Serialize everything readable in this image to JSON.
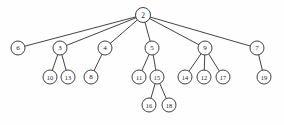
{
  "figure": {
    "background_color": "#fefefe",
    "node_fill_color": "#ffffff",
    "node_stroke_color": "#2b2b2b",
    "edge_color": "#2e2e2e",
    "label_color": "#1a1a1a",
    "width": 284,
    "height": 125
  },
  "chart_data": {
    "type": "diagram",
    "diagram_type": "tree",
    "title": "",
    "root": "2",
    "node_count": 19,
    "edge_count": 18,
    "depth": 4,
    "nodes": [
      {
        "id": "2",
        "label": "2",
        "x": 143,
        "y": 15,
        "r": 7.5,
        "level": 0,
        "font_size": 7.5
      },
      {
        "id": "6",
        "label": "6",
        "x": 18,
        "y": 48,
        "r": 7.0,
        "level": 1,
        "font_size": 7.0
      },
      {
        "id": "3",
        "label": "3",
        "x": 60,
        "y": 48,
        "r": 7.0,
        "level": 1,
        "font_size": 7.0
      },
      {
        "id": "4",
        "label": "4",
        "x": 105,
        "y": 48,
        "r": 7.0,
        "level": 1,
        "font_size": 7.0
      },
      {
        "id": "5",
        "label": "5",
        "x": 152,
        "y": 48,
        "r": 7.0,
        "level": 1,
        "font_size": 7.0
      },
      {
        "id": "9",
        "label": "9",
        "x": 205,
        "y": 48,
        "r": 7.0,
        "level": 1,
        "font_size": 7.0
      },
      {
        "id": "7",
        "label": "7",
        "x": 257,
        "y": 48,
        "r": 7.0,
        "level": 1,
        "font_size": 7.0
      },
      {
        "id": "10",
        "label": "10",
        "x": 50,
        "y": 77,
        "r": 7.0,
        "level": 2,
        "font_size": 6.4
      },
      {
        "id": "13",
        "label": "13",
        "x": 68,
        "y": 77,
        "r": 7.0,
        "level": 2,
        "font_size": 6.4
      },
      {
        "id": "8",
        "label": "8",
        "x": 91,
        "y": 77,
        "r": 7.0,
        "level": 2,
        "font_size": 7.0
      },
      {
        "id": "11",
        "label": "11",
        "x": 139,
        "y": 77,
        "r": 7.0,
        "level": 2,
        "font_size": 6.4
      },
      {
        "id": "15",
        "label": "15",
        "x": 157,
        "y": 77,
        "r": 7.0,
        "level": 2,
        "font_size": 6.4
      },
      {
        "id": "14",
        "label": "14",
        "x": 185,
        "y": 77,
        "r": 7.0,
        "level": 2,
        "font_size": 6.4
      },
      {
        "id": "12",
        "label": "12",
        "x": 204,
        "y": 77,
        "r": 7.0,
        "level": 2,
        "font_size": 6.4
      },
      {
        "id": "17",
        "label": "17",
        "x": 223,
        "y": 77,
        "r": 7.0,
        "level": 2,
        "font_size": 6.4
      },
      {
        "id": "19",
        "label": "19",
        "x": 264,
        "y": 77,
        "r": 7.0,
        "level": 2,
        "font_size": 6.4
      },
      {
        "id": "16",
        "label": "16",
        "x": 149,
        "y": 105,
        "r": 7.0,
        "level": 3,
        "font_size": 6.4
      },
      {
        "id": "18",
        "label": "18",
        "x": 169,
        "y": 105,
        "r": 7.0,
        "level": 3,
        "font_size": 6.4
      }
    ],
    "edges": [
      {
        "from": "2",
        "to": "6"
      },
      {
        "from": "2",
        "to": "3"
      },
      {
        "from": "2",
        "to": "4"
      },
      {
        "from": "2",
        "to": "5"
      },
      {
        "from": "2",
        "to": "9"
      },
      {
        "from": "2",
        "to": "7"
      },
      {
        "from": "3",
        "to": "10"
      },
      {
        "from": "3",
        "to": "13"
      },
      {
        "from": "4",
        "to": "8"
      },
      {
        "from": "5",
        "to": "11"
      },
      {
        "from": "5",
        "to": "15"
      },
      {
        "from": "9",
        "to": "14"
      },
      {
        "from": "9",
        "to": "12"
      },
      {
        "from": "9",
        "to": "17"
      },
      {
        "from": "7",
        "to": "19"
      },
      {
        "from": "15",
        "to": "16"
      },
      {
        "from": "15",
        "to": "18"
      }
    ],
    "adjacency": {
      "2": [
        "6",
        "3",
        "4",
        "5",
        "9",
        "7"
      ],
      "3": [
        "10",
        "13"
      ],
      "4": [
        "8"
      ],
      "5": [
        "11",
        "15"
      ],
      "9": [
        "14",
        "12",
        "17"
      ],
      "7": [
        "19"
      ],
      "15": [
        "16",
        "18"
      ]
    }
  }
}
